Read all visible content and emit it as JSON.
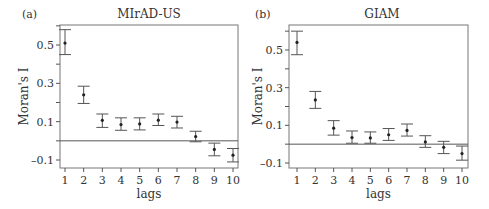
{
  "chart_data": [
    {
      "type": "scatter",
      "panel_label": "(a)",
      "title": "MIrAD-US",
      "xlabel": "lags",
      "ylabel": "Moran's I",
      "x": [
        1,
        2,
        3,
        4,
        5,
        6,
        7,
        8,
        9,
        10
      ],
      "series": [
        {
          "name": "Moran's I",
          "values": [
            0.51,
            0.24,
            0.107,
            0.085,
            0.088,
            0.108,
            0.098,
            0.022,
            -0.045,
            -0.075
          ],
          "ci_upper": [
            0.58,
            0.285,
            0.14,
            0.12,
            0.12,
            0.14,
            0.128,
            0.05,
            -0.012,
            -0.04
          ],
          "ci_lower": [
            0.45,
            0.195,
            0.07,
            0.055,
            0.057,
            0.08,
            0.067,
            -0.005,
            -0.078,
            -0.11
          ]
        }
      ],
      "yticks": [
        -0.1,
        0.1,
        0.3,
        0.5
      ],
      "ytick_labels": [
        "–0.1",
        "0.1",
        "0.3",
        "0.5"
      ],
      "xticks": [
        "1",
        "2",
        "3",
        "4",
        "5",
        "6",
        "7",
        "8",
        "9",
        "10"
      ],
      "ylim": [
        -0.14,
        0.6
      ],
      "reference_line": 0,
      "grid": false,
      "legend": "none"
    },
    {
      "type": "scatter",
      "panel_label": "(b)",
      "title": "GIAM",
      "xlabel": "lags",
      "ylabel": "Moran's I",
      "x": [
        1,
        2,
        3,
        4,
        5,
        6,
        7,
        8,
        9,
        10
      ],
      "series": [
        {
          "name": "Moran's I",
          "values": [
            0.54,
            0.235,
            0.085,
            0.035,
            0.033,
            0.05,
            0.073,
            0.012,
            -0.017,
            -0.05
          ],
          "ci_upper": [
            0.6,
            0.28,
            0.125,
            0.07,
            0.065,
            0.083,
            0.107,
            0.045,
            0.015,
            -0.01
          ],
          "ci_lower": [
            0.475,
            0.19,
            0.048,
            0.005,
            0.005,
            0.02,
            0.043,
            -0.017,
            -0.05,
            -0.085
          ]
        }
      ],
      "yticks": [
        -0.1,
        0.1,
        0.3,
        0.5
      ],
      "ytick_labels": [
        "–0.1",
        "0.1",
        "0.3",
        "0.5"
      ],
      "xticks": [
        "1",
        "2",
        "3",
        "4",
        "5",
        "6",
        "7",
        "8",
        "9",
        "10"
      ],
      "ylim": [
        -0.12,
        0.62
      ],
      "reference_line": 0,
      "grid": false,
      "legend": "none"
    }
  ]
}
